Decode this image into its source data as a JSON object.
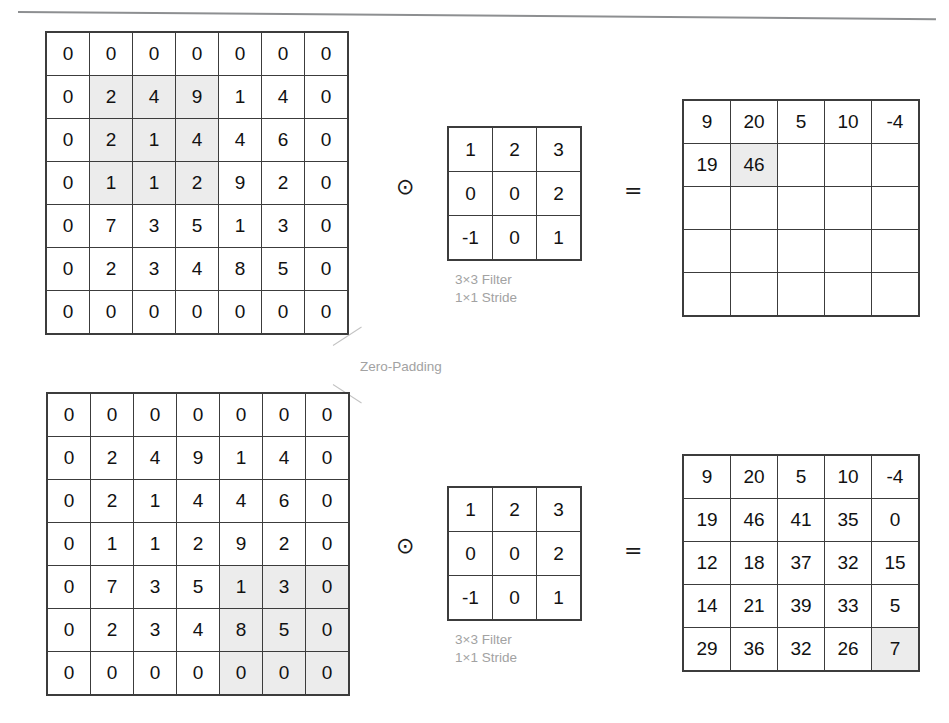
{
  "operators": {
    "convolution": "⊙",
    "equals": "="
  },
  "annotations": {
    "zero_padding_label": "Zero-Padding"
  },
  "filter_caption": {
    "size": "3×3 Filter",
    "stride": "1×1 Stride"
  },
  "rows": [
    {
      "name": "first-step",
      "input": {
        "label": "zero-padded-input-matrix",
        "rows": 7,
        "cols": 7,
        "values": [
          [
            0,
            0,
            0,
            0,
            0,
            0,
            0
          ],
          [
            0,
            2,
            4,
            9,
            1,
            4,
            0
          ],
          [
            0,
            2,
            1,
            4,
            4,
            6,
            0
          ],
          [
            0,
            1,
            1,
            2,
            9,
            2,
            0
          ],
          [
            0,
            7,
            3,
            5,
            1,
            3,
            0
          ],
          [
            0,
            2,
            3,
            4,
            8,
            5,
            0
          ],
          [
            0,
            0,
            0,
            0,
            0,
            0,
            0
          ]
        ],
        "highlight": [
          [
            1,
            1
          ],
          [
            1,
            2
          ],
          [
            1,
            3
          ],
          [
            2,
            1
          ],
          [
            2,
            2
          ],
          [
            2,
            3
          ],
          [
            3,
            1
          ],
          [
            3,
            2
          ],
          [
            3,
            3
          ]
        ]
      },
      "filter": {
        "label": "convolution-filter",
        "rows": 3,
        "cols": 3,
        "values": [
          [
            1,
            2,
            3
          ],
          [
            0,
            0,
            2
          ],
          [
            -1,
            0,
            1
          ]
        ],
        "highlight": []
      },
      "output": {
        "label": "feature-map-partial",
        "rows": 5,
        "cols": 5,
        "values": [
          [
            9,
            20,
            5,
            10,
            -4
          ],
          [
            19,
            46,
            "",
            "",
            ""
          ],
          [
            "",
            "",
            "",
            "",
            ""
          ],
          [
            "",
            "",
            "",
            "",
            ""
          ],
          [
            "",
            "",
            "",
            "",
            ""
          ]
        ],
        "highlight": [
          [
            1,
            1
          ]
        ]
      }
    },
    {
      "name": "final-step",
      "input": {
        "label": "zero-padded-input-matrix",
        "rows": 7,
        "cols": 7,
        "values": [
          [
            0,
            0,
            0,
            0,
            0,
            0,
            0
          ],
          [
            0,
            2,
            4,
            9,
            1,
            4,
            0
          ],
          [
            0,
            2,
            1,
            4,
            4,
            6,
            0
          ],
          [
            0,
            1,
            1,
            2,
            9,
            2,
            0
          ],
          [
            0,
            7,
            3,
            5,
            1,
            3,
            0
          ],
          [
            0,
            2,
            3,
            4,
            8,
            5,
            0
          ],
          [
            0,
            0,
            0,
            0,
            0,
            0,
            0
          ]
        ],
        "highlight": [
          [
            4,
            4
          ],
          [
            4,
            5
          ],
          [
            4,
            6
          ],
          [
            5,
            4
          ],
          [
            5,
            5
          ],
          [
            5,
            6
          ],
          [
            6,
            4
          ],
          [
            6,
            5
          ],
          [
            6,
            6
          ]
        ]
      },
      "filter": {
        "label": "convolution-filter",
        "rows": 3,
        "cols": 3,
        "values": [
          [
            1,
            2,
            3
          ],
          [
            0,
            0,
            2
          ],
          [
            -1,
            0,
            1
          ]
        ],
        "highlight": []
      },
      "output": {
        "label": "feature-map-complete",
        "rows": 5,
        "cols": 5,
        "values": [
          [
            9,
            20,
            5,
            10,
            -4
          ],
          [
            19,
            46,
            41,
            35,
            0
          ],
          [
            12,
            18,
            37,
            32,
            15
          ],
          [
            14,
            21,
            39,
            33,
            5
          ],
          [
            29,
            36,
            32,
            26,
            7
          ]
        ],
        "highlight": [
          [
            4,
            4
          ]
        ]
      }
    }
  ],
  "colors": {
    "grid_line": "#3c3c3c",
    "highlight_fill": "#ececec",
    "caption_text": "#a2a2a2",
    "value_text": "#111111"
  }
}
